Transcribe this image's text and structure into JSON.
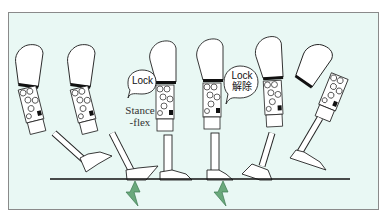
{
  "diagram": {
    "type": "prosthetic-knee-gait-sequence",
    "background_color": "#e9f8f4",
    "frame_border_color": "#8a8a8a",
    "ground_line_color": "#111111",
    "arrow_color": "#5a9a6a",
    "legs": [
      {
        "index": 1,
        "phase": "swing-extension"
      },
      {
        "index": 2,
        "phase": "heel-strike"
      },
      {
        "index": 3,
        "phase": "mid-stance"
      },
      {
        "index": 4,
        "phase": "terminal-stance"
      },
      {
        "index": 5,
        "phase": "pre-swing"
      },
      {
        "index": 6,
        "phase": "swing-flexion"
      }
    ],
    "bubbles": [
      {
        "id": "lock",
        "line1": "Lock",
        "line2": ""
      },
      {
        "id": "lock-release",
        "line1": "Lock",
        "line2": "解除"
      }
    ],
    "annotation": {
      "line1": "Stance",
      "line2": "-flex"
    },
    "arrows": [
      {
        "id": "ground-reaction-1",
        "meaning": "ground reaction force at heel strike"
      },
      {
        "id": "ground-reaction-2",
        "meaning": "ground reaction force at toe"
      }
    ]
  }
}
